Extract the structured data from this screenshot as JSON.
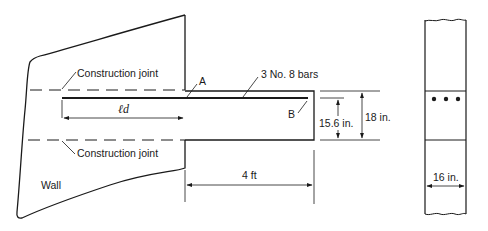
{
  "diagram": {
    "type": "structural cantilever beam with wall, elevation and cross-section",
    "labels": {
      "construction_joint_top": "Construction joint",
      "construction_joint_bottom": "Construction joint",
      "point_a": "A",
      "point_b": "B",
      "bars": "3 No. 8 bars",
      "development_length": "ℓd",
      "wall": "Wall",
      "length": "4 ft",
      "effective_depth": "15.6 in.",
      "total_depth": "18 in.",
      "width": "16 in."
    },
    "section": {
      "bar_count": 3
    }
  }
}
